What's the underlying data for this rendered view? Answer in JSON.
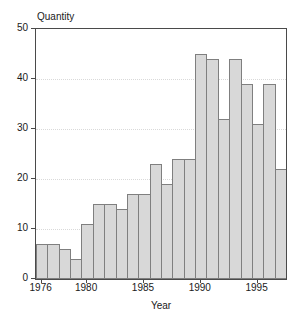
{
  "chart_data": {
    "type": "bar",
    "title": "Quantity",
    "xlabel": "Year",
    "ylabel": "Quantity",
    "categories": [
      1976,
      1977,
      1978,
      1979,
      1980,
      1981,
      1982,
      1983,
      1984,
      1985,
      1986,
      1987,
      1988,
      1989,
      1990,
      1991,
      1992,
      1993,
      1994,
      1995,
      1996,
      1997
    ],
    "values": [
      7,
      7,
      6,
      4,
      11,
      15,
      15,
      14,
      17,
      17,
      23,
      19,
      24,
      24,
      45,
      44,
      32,
      44,
      39,
      31,
      39,
      22
    ],
    "ylim": [
      0,
      50
    ],
    "yticks": [
      0,
      10,
      20,
      30,
      40,
      50
    ],
    "xticks": [
      1976,
      1980,
      1985,
      1990,
      1995
    ],
    "grid": "horizontal dotted at 10,20,30,40",
    "legend_position": "none",
    "colors": {
      "bar_fill": "#d8d8d8",
      "bar_border": "#7f7f7f",
      "axis": "#4a4a4a",
      "gridline": "#d9d9d9",
      "text": "#1a1a1a",
      "background": "#ffffff"
    }
  }
}
